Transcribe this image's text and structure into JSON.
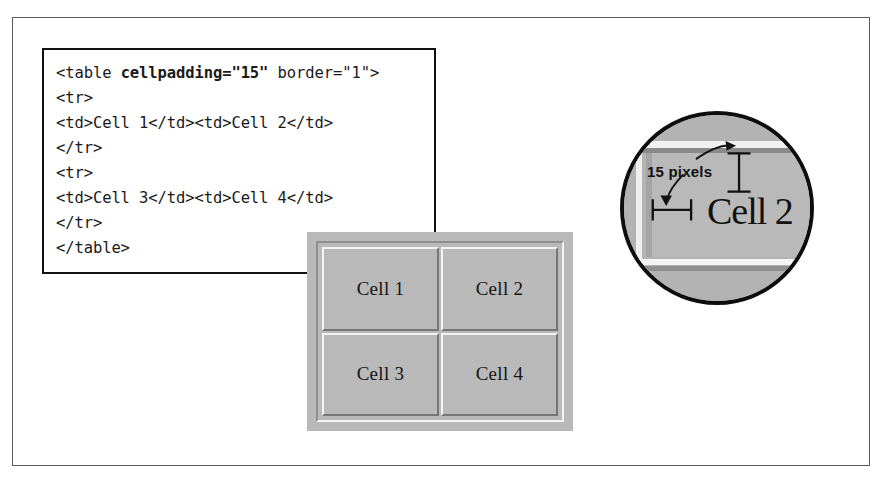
{
  "code_box": {
    "language": "html",
    "lines": [
      {
        "plain_before": "<table ",
        "bold": "cellpadding=\"15\"",
        "plain_after": " border=\"1\">"
      },
      {
        "plain_before": "<tr>",
        "bold": "",
        "plain_after": ""
      },
      {
        "plain_before": "<td>Cell 1</td><td>Cell 2</td>",
        "bold": "",
        "plain_after": ""
      },
      {
        "plain_before": "</tr>",
        "bold": "",
        "plain_after": ""
      },
      {
        "plain_before": "<tr>",
        "bold": "",
        "plain_after": ""
      },
      {
        "plain_before": "<td>Cell 3</td><td>Cell 4</td>",
        "bold": "",
        "plain_after": ""
      },
      {
        "plain_before": "</tr>",
        "bold": "",
        "plain_after": ""
      },
      {
        "plain_before": "</table>",
        "bold": "",
        "plain_after": ""
      }
    ]
  },
  "rendered_table": {
    "rows": [
      [
        "Cell 1",
        "Cell 2"
      ],
      [
        "Cell 3",
        "Cell 4"
      ]
    ],
    "attributes": {
      "cellpadding": "15",
      "border": "1"
    }
  },
  "magnifier": {
    "annotation_label": "15 pixels",
    "zoomed_cell_text": "Cell 2"
  },
  "colors": {
    "frame_line": "#5a5a5a",
    "code_border": "#111111",
    "code_text": "#1a1a1a",
    "table_face": "#b9b9b9",
    "bevel_light": "#f4f4f4",
    "bevel_dark": "#767676",
    "magnifier_ring": "#0d0d0d"
  }
}
